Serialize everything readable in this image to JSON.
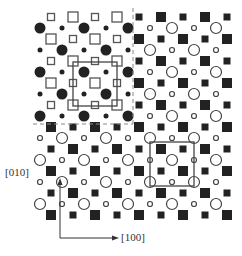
{
  "diagram": {
    "title": "",
    "grid": {
      "origin_x": 40,
      "origin_y": 17,
      "step": 11,
      "cols": 18,
      "rows": 19
    },
    "regions": [
      {
        "name": "upper-left",
        "col_range": [
          0,
          8
        ],
        "row_range": [
          0,
          9
        ],
        "square_style": "open",
        "circle_style": "filled"
      },
      {
        "name": "upper-right",
        "col_range": [
          9,
          17
        ],
        "row_range": [
          0,
          9
        ],
        "square_style": "filled",
        "circle_style": "open"
      },
      {
        "name": "lower-left",
        "col_range": [
          0,
          8
        ],
        "row_range": [
          10,
          18
        ],
        "square_style": "filled",
        "circle_style": "open"
      },
      {
        "name": "lower-right",
        "col_range": [
          9,
          17
        ],
        "row_range": [
          10,
          18
        ],
        "square_style": "filled",
        "circle_style": "open"
      }
    ],
    "sizes": {
      "square_large": 10,
      "square_small": 7,
      "circle_large": 11,
      "circle_small": 5,
      "open_circle_large": 11,
      "open_circle_small": 5
    },
    "divider": {
      "vertical_x": 133,
      "horizontal_y": 124,
      "style": "dashed",
      "color": "#888888"
    },
    "unit_cells": [
      {
        "name": "unit-cell-upper-left",
        "x1": 73,
        "y1": 62,
        "x2": 117,
        "y2": 106,
        "style": "open-square-cell"
      },
      {
        "name": "unit-cell-lower-right",
        "x1": 150,
        "y1": 142,
        "x2": 194,
        "y2": 186,
        "style": "open-circle-cell"
      }
    ],
    "axes": {
      "origin": [
        60,
        238
      ],
      "y_end": [
        60,
        178
      ],
      "x_end": [
        119,
        238
      ],
      "y_label": "[010]",
      "x_label": "[100]"
    },
    "colors": {
      "ink": "#222222",
      "line": "#444444"
    }
  }
}
